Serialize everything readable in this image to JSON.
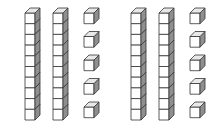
{
  "diagram": {
    "groups": [
      {
        "tens_rods": 2,
        "ones_cubes": 5,
        "value": 25
      },
      {
        "tens_rods": 2,
        "ones_cubes": 5,
        "value": 25
      }
    ],
    "cubes_per_rod": 10,
    "colors": {
      "front": "#ffffff",
      "top": "#e8e8e8",
      "side": "#8f8f8f",
      "stroke": "#333333"
    }
  }
}
